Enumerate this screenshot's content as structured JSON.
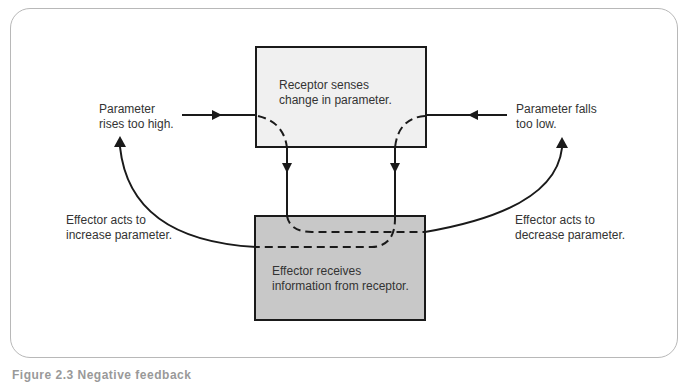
{
  "diagram": {
    "nodes": {
      "receptor": {
        "line1": "Receptor senses",
        "line2": "change in parameter.",
        "fill": "#f0f0f0"
      },
      "effector": {
        "line1": "Effector receives",
        "line2": "information from receptor.",
        "fill": "#c8c8c8"
      }
    },
    "labels": {
      "rises": {
        "line1": "Parameter",
        "line2": "rises too high."
      },
      "falls": {
        "line1": "Parameter falls",
        "line2": "too low."
      },
      "increase": {
        "line1": "Effector acts to",
        "line2": "increase parameter."
      },
      "decrease": {
        "line1": "Effector acts to",
        "line2": "decrease parameter."
      }
    },
    "edges": [
      {
        "from": "Parameter rises too high",
        "to": "receptor",
        "style": "solid"
      },
      {
        "from": "Parameter falls too low",
        "to": "receptor",
        "style": "solid"
      },
      {
        "from": "receptor",
        "to": "effector",
        "style": "solid"
      },
      {
        "from": "effector",
        "to": "Parameter rises too high",
        "label": "Effector acts to increase parameter.",
        "style": "curved"
      },
      {
        "from": "effector",
        "to": "Parameter falls too low",
        "label": "Effector acts to decrease parameter.",
        "style": "curved"
      }
    ],
    "colors": {
      "line": "#1a1a1a",
      "frame": "#b8b8b8"
    }
  },
  "caption": "Figure 2.3 Negative feedback"
}
